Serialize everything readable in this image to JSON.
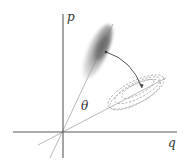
{
  "diagram": {
    "type": "phase-space-rotation",
    "axes": {
      "horizontal_label": "q",
      "vertical_label": "p"
    },
    "angle_label": "θ",
    "elements": [
      {
        "name": "original-distribution",
        "style": "filled gray blob",
        "orientation": "along rotated p-axis"
      },
      {
        "name": "rotated-distribution",
        "style": "dashed nested ellipses",
        "orientation": "along rotated q-axis"
      },
      {
        "name": "rotation-arrow",
        "from": "original-distribution center",
        "to": "rotated-distribution center"
      }
    ],
    "colors": {
      "axis": "#555555",
      "rotated_axis": "#aaaaaa",
      "blob_dark": "#6e6e6e",
      "blob_light": "#c8c8c8",
      "dashed": "#9a9a9a",
      "arrow": "#444444"
    }
  }
}
